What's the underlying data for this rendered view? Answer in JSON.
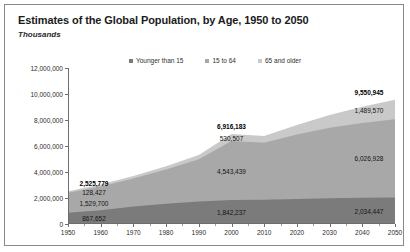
{
  "figure": {
    "title": "Estimates of the Global Population, by Age, 1950 to 2050",
    "subtitle": "Thousands"
  },
  "chart_data": {
    "type": "area",
    "stacked": true,
    "title": "Estimates of the Global Population, by Age, 1950 to 2050",
    "subtitle": "Thousands",
    "xlabel": "",
    "ylabel": "Thousands",
    "xlim": [
      1950,
      2050
    ],
    "ylim": [
      0,
      12000000
    ],
    "ytick_step": 2000000,
    "grid": false,
    "legend_position": "top",
    "x": [
      1950,
      1960,
      1970,
      1980,
      1990,
      2000,
      2010,
      2020,
      2030,
      2040,
      2050
    ],
    "xtick_labels": [
      "1950",
      "1960",
      "1970",
      "1980",
      "1990",
      "2000",
      "2010",
      "2020",
      "2030",
      "2040",
      "2050"
    ],
    "ytick_labels": [
      "0",
      "2,000,000",
      "4,000,000",
      "6,000,000",
      "8,000,000",
      "10,000,000",
      "12,000,000"
    ],
    "ytick_values": [
      0,
      2000000,
      4000000,
      6000000,
      8000000,
      10000000,
      12000000
    ],
    "series": [
      {
        "name": "Younger than 15",
        "color": "#7b7b7b",
        "values": [
          867652,
          1057000,
          1337000,
          1550000,
          1726000,
          1842237,
          1862000,
          1930000,
          1975000,
          2010000,
          2034447
        ]
      },
      {
        "name": "15 to 64",
        "color": "#a8a8a8",
        "values": [
          1529700,
          1820000,
          2155000,
          2640000,
          3250000,
          4543439,
          4380000,
          4950000,
          5420000,
          5760000,
          6026928
        ]
      },
      {
        "name": "65 and older",
        "color": "#c9c9c9",
        "values": [
          128427,
          156000,
          196000,
          255000,
          330000,
          530507,
          525000,
          730000,
          995000,
          1250000,
          1489570
        ]
      }
    ],
    "totals": [
      2525779,
      3033000,
      3688000,
      4445000,
      5306000,
      6916183,
      6767000,
      7610000,
      8390000,
      9020000,
      9550945
    ],
    "annotations": [
      {
        "x": 1950,
        "series": "total",
        "text": "2,525,779",
        "bold": true
      },
      {
        "x": 1950,
        "series": "65 and older",
        "text": "128,427",
        "bold": false
      },
      {
        "x": 1950,
        "series": "15 to 64",
        "text": "1,529,700",
        "bold": false
      },
      {
        "x": 1950,
        "series": "Younger than 15",
        "text": "867,652",
        "bold": false
      },
      {
        "x": 2000,
        "series": "total",
        "text": "6,916,183",
        "bold": true
      },
      {
        "x": 2000,
        "series": "65 and older",
        "text": "530,507",
        "bold": false
      },
      {
        "x": 2000,
        "series": "15 to 64",
        "text": "4,543,439",
        "bold": false
      },
      {
        "x": 2000,
        "series": "Younger than 15",
        "text": "1,842,237",
        "bold": false
      },
      {
        "x": 2050,
        "series": "total",
        "text": "9,550,945",
        "bold": true
      },
      {
        "x": 2050,
        "series": "65 and older",
        "text": "1,489,570",
        "bold": false
      },
      {
        "x": 2050,
        "series": "15 to 64",
        "text": "6,026,928",
        "bold": false
      },
      {
        "x": 2050,
        "series": "Younger than 15",
        "text": "2,034,447",
        "bold": false
      }
    ]
  }
}
